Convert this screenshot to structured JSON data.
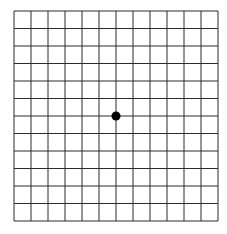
{
  "diagram": {
    "type": "amsler-grid",
    "rows": 12,
    "cols": 12,
    "grid": {
      "left": 14,
      "top": 11,
      "right": 218,
      "bottom": 221
    },
    "line_color": "#2a2a2a",
    "dot": {
      "cx": 116,
      "cy": 116,
      "r": 4.5,
      "color": "#000000"
    }
  }
}
